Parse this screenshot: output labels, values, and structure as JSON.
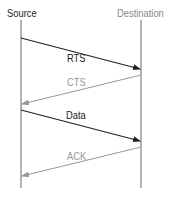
{
  "diagram": {
    "type": "sequence",
    "participants": [
      {
        "name": "Source",
        "x": 21,
        "color": "#222222"
      },
      {
        "name": "Destination",
        "x": 141,
        "color": "#888888"
      }
    ],
    "messages": [
      {
        "label": "RTS",
        "from": "Source",
        "to": "Destination",
        "color": "#222222",
        "y1": 38,
        "y2": 69,
        "label_x": 68,
        "label_y": 52
      },
      {
        "label": "CTS",
        "from": "Destination",
        "to": "Source",
        "color": "#999999",
        "y1": 75,
        "y2": 104,
        "label_x": 68,
        "label_y": 76
      },
      {
        "label": "Data",
        "from": "Source",
        "to": "Destination",
        "color": "#222222",
        "y1": 110,
        "y2": 141,
        "label_x": 67,
        "label_y": 108
      },
      {
        "label": "ACK",
        "from": "Destination",
        "to": "Source",
        "color": "#999999",
        "y1": 147,
        "y2": 176,
        "label_x": 68,
        "label_y": 149
      }
    ]
  }
}
